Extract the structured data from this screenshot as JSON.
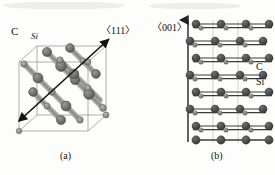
{
  "figure": {
    "kind": "crystal-structure-diagram",
    "material": "SiC",
    "background_hex": "#fdfdfb",
    "ink_hex": "#1a1a1a"
  },
  "panel_a": {
    "caption": "(a)",
    "view": "cubic unit cell, perspective",
    "direction_label": "〈111〉",
    "atom_labels": [
      {
        "name": "C",
        "text": "C"
      },
      {
        "name": "Si",
        "text": "Si"
      }
    ],
    "atoms": {
      "c_color_hex": "#8e8e8e",
      "si_color_hex": "#6b6b6b",
      "c_radius": 3.2,
      "si_radius": 5.0
    },
    "cell_edge_hex": "#9a9a95",
    "arrow_hex": "#141414",
    "arrow": {
      "x1": 19,
      "y1": 121,
      "x2": 109,
      "y2": 39
    },
    "cube": {
      "front": [
        [
          19,
          62
        ],
        [
          88,
          62
        ],
        [
          88,
          131
        ],
        [
          19,
          131
        ]
      ],
      "back": [
        [
          37,
          46
        ],
        [
          106,
          46
        ],
        [
          106,
          115
        ],
        [
          37,
          115
        ]
      ]
    },
    "chains": [
      {
        "name": "chain-1",
        "points": [
          [
            24,
            64
          ],
          [
            38,
            78
          ],
          [
            52,
            92
          ],
          [
            66,
            106
          ],
          [
            80,
            120
          ]
        ]
      },
      {
        "name": "chain-2",
        "points": [
          [
            47,
            52
          ],
          [
            61,
            66
          ],
          [
            75,
            80
          ],
          [
            89,
            94
          ],
          [
            103,
            108
          ]
        ]
      },
      {
        "name": "chain-3",
        "points": [
          [
            60,
            60
          ],
          [
            74,
            74
          ],
          [
            88,
            88
          ],
          [
            100,
            100
          ]
        ]
      },
      {
        "name": "chain-4",
        "points": [
          [
            33,
            92
          ],
          [
            47,
            106
          ],
          [
            61,
            120
          ]
        ]
      }
    ]
  },
  "panel_b": {
    "caption": "(b)",
    "view": "side view of stacked bilayers",
    "direction_label": "〈001〉",
    "atom_labels": [
      {
        "name": "C",
        "text": "C"
      },
      {
        "name": "Si",
        "text": "Si"
      }
    ],
    "axis_arrow": {
      "x": 188,
      "y_bottom": 142,
      "y_top": 19
    },
    "guide_line_hex": "#b9b9b4",
    "guide_lines_x": [
      213,
      238
    ],
    "bond_hex": "#3a3a3a",
    "atoms": {
      "si_color_hex": "#4a4a4a",
      "c_color_hex": "#7d7d7d",
      "si_radius": 4.3,
      "c_radius": 2.5
    },
    "columns_x": [
      196,
      221,
      246,
      268
    ],
    "rows": [
      {
        "name": "row-1",
        "y": 24,
        "offset": 0,
        "type": "bilayer"
      },
      {
        "name": "row-2",
        "y": 41,
        "offset": -6,
        "type": "bilayer"
      },
      {
        "name": "row-3",
        "y": 58,
        "offset": 0,
        "type": "bilayer"
      },
      {
        "name": "row-4",
        "y": 75,
        "offset": -6,
        "type": "bilayer"
      },
      {
        "name": "row-5",
        "y": 92,
        "offset": 0,
        "type": "bilayer"
      },
      {
        "name": "row-6",
        "y": 109,
        "offset": -6,
        "type": "bilayer"
      },
      {
        "name": "row-7",
        "y": 126,
        "offset": 0,
        "type": "bilayer"
      },
      {
        "name": "row-8",
        "y": 140,
        "offset": 0,
        "type": "plain"
      }
    ]
  }
}
